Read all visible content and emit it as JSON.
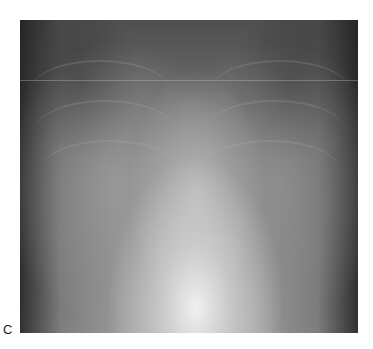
{
  "figure": {
    "panel_label": "C",
    "image": {
      "subject": "chest-radiograph",
      "description": "Frontal chest X-ray, grayscale, with bright central mediastinum/heart shadow and diffuse bilateral lung opacity"
    },
    "colors": {
      "background": "#ffffff",
      "label": "#222222"
    }
  }
}
